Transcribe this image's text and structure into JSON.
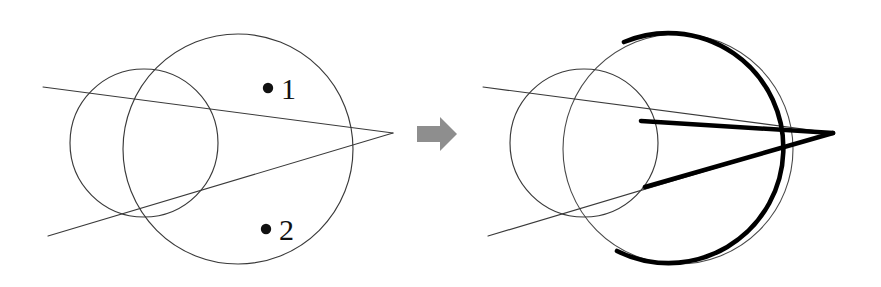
{
  "figure": {
    "background_color": "#ffffff",
    "width": 881,
    "height": 287,
    "colors": {
      "thin_line": "#3a3a3a",
      "bold_line": "#000000",
      "arrow": "#8e8e8e",
      "label": "#111111"
    },
    "labels": {
      "point_one": "1",
      "point_two": "2",
      "bullet": "•"
    },
    "arrow_icon": "right-arrow-icon",
    "panels": [
      {
        "name": "before-panel",
        "offset_x": 0,
        "description": "Two overlapping circles with two straight lines meeting at a right-hand apex; two labelled sample points 1 and 2 inside the large circle.",
        "small_circle": {
          "cx": 144,
          "cy": 143,
          "r": 74,
          "stroke": "thin"
        },
        "large_circle": {
          "cx": 238,
          "cy": 149,
          "r": 115,
          "stroke": "thin"
        },
        "apex": {
          "x": 393,
          "y": 133
        },
        "upper_line": {
          "x1": 43,
          "y1": 87,
          "x2": 393,
          "y2": 133
        },
        "lower_line": {
          "x1": 48,
          "y1": 236,
          "x2": 393,
          "y2": 133
        },
        "point_one": {
          "dot_x": 268,
          "dot_y": 88,
          "label_x": 281,
          "label_y": 99
        },
        "point_two": {
          "dot_x": 266,
          "dot_y": 229,
          "label_x": 279,
          "label_y": 240
        }
      },
      {
        "name": "after-panel",
        "offset_x": 440,
        "description": "Same construction with the outer silhouette emphasised: the large circle arc outside the small circle plus the two tangent segments running to the apex are drawn in heavy black.",
        "small_circle": {
          "cx": 584,
          "cy": 143,
          "r": 74,
          "stroke": "thin"
        },
        "large_circle": {
          "cx": 678,
          "cy": 149,
          "r": 115,
          "stroke": "thin"
        },
        "apex": {
          "x": 833,
          "y": 133
        },
        "upper_line": {
          "x1": 483,
          "y1": 87,
          "x2": 833,
          "y2": 133
        },
        "lower_line": {
          "x1": 488,
          "y1": 236,
          "x2": 833,
          "y2": 133
        },
        "bold_arc": {
          "from_angle_deg": -118,
          "to_angle_deg": 118,
          "sweep": "clockwise-through-right"
        },
        "bold_upper_segment": {
          "x1": 641,
          "y1": 121,
          "x2": 833,
          "y2": 133
        },
        "bold_lower_segment": {
          "x1": 645,
          "y1": 187,
          "x2": 833,
          "y2": 133
        }
      }
    ],
    "arrow": {
      "name": "transition-arrow",
      "x": 417,
      "y": 117,
      "width": 40,
      "height": 34,
      "direction": "right"
    }
  }
}
